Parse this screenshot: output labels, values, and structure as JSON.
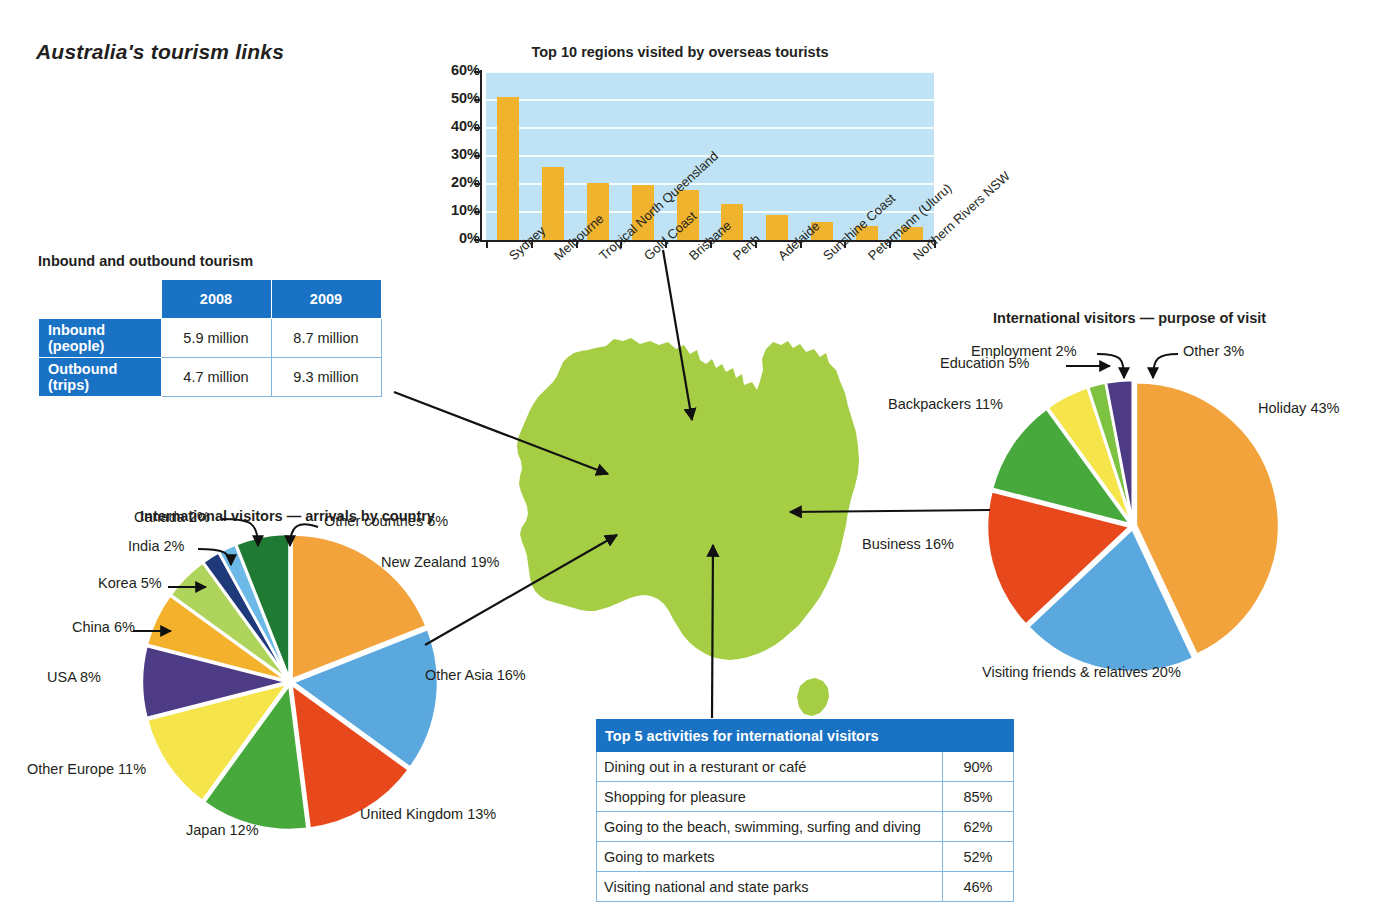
{
  "title": "Australia's tourism links",
  "bar_section": {
    "title": "Top 10 regions visited by overseas tourists"
  },
  "inbound_table": {
    "title": "Inbound and outbound tourism",
    "corner": "",
    "columns": [
      "2008",
      "2009"
    ],
    "rows": [
      {
        "label": "Inbound (people)",
        "v2008": "5.9 million",
        "v2009": "8.7 million"
      },
      {
        "label": "Outbound (trips)",
        "v2008": "4.7 million",
        "v2009": "9.3 million"
      }
    ]
  },
  "activities_table": {
    "title": "Top 5 activities for international visitors",
    "rows": [
      {
        "activity": "Dining out in a resturant or café",
        "pct": "90%"
      },
      {
        "activity": "Shopping for pleasure",
        "pct": "85%"
      },
      {
        "activity": "Going to the beach, swimming, surfing and diving",
        "pct": "62%"
      },
      {
        "activity": "Going to markets",
        "pct": "52%"
      },
      {
        "activity": "Visiting national and state parks",
        "pct": "46%"
      }
    ]
  },
  "arrivals_pie": {
    "title": "International visitors — arrivals by country",
    "labels": {
      "new_zealand": "New Zealand 19%",
      "other_asia": "Other Asia 16%",
      "united_kingdom": "United Kingdom 13%",
      "japan": "Japan 12%",
      "other_europe": "Other Europe 11%",
      "usa": "USA 8%",
      "china": "China 6%",
      "korea": "Korea 5%",
      "india": "India 2%",
      "canada": "Canada 2%",
      "other_countries": "Other countries 6%"
    }
  },
  "purpose_pie": {
    "title": "International visitors — purpose of visit",
    "labels": {
      "holiday": "Holiday 43%",
      "vfr": "Visiting friends & relatives 20%",
      "business": "Business 16%",
      "backpackers": "Backpackers 11%",
      "education": "Education 5%",
      "employment": "Employment 2%",
      "other": "Other 3%"
    }
  },
  "colors": {
    "blue_header": "#1a72c4",
    "plot_blue": "#bfe3f5",
    "bar_gold": "#f0b32d",
    "map_green": "#a5ce44",
    "orange": "#f2a33c",
    "sky": "#5ba8de",
    "red": "#e8491c",
    "green": "#47a83c",
    "yellow": "#f6e44b",
    "purple": "#4d3b86",
    "amber": "#f4b12c",
    "lightgreen": "#aed45c",
    "navy": "#1f3a7a",
    "lightblue": "#6cb9e8",
    "darkgreen": "#1f7a33"
  },
  "chart_data": [
    {
      "type": "bar",
      "title": "Top 10 regions visited by overseas tourists",
      "xlabel": "",
      "ylabel": "",
      "ylim": [
        0,
        60
      ],
      "ytick_labels": [
        "0%",
        "10%",
        "20%",
        "30%",
        "40%",
        "50%",
        "60%"
      ],
      "grid": true,
      "categories": [
        "Sydney",
        "Melbourne",
        "Tropical North Queensland",
        "Gold Coast",
        "Brisbane",
        "Perth",
        "Adelaide",
        "Sunshine Coast",
        "Petermann (Uluru)",
        "Northern Rivers NSW"
      ],
      "values": [
        51,
        26,
        20.5,
        19.5,
        18,
        13,
        9,
        6.5,
        5,
        4.5
      ]
    },
    {
      "type": "pie",
      "title": "International visitors — arrivals by country",
      "legend": "labelled-slices",
      "categories": [
        "New Zealand",
        "Other Asia",
        "United Kingdom",
        "Japan",
        "Other Europe",
        "USA",
        "China",
        "Korea",
        "India",
        "Canada",
        "Other countries"
      ],
      "values": [
        19,
        16,
        13,
        12,
        11,
        8,
        6,
        5,
        2,
        2,
        6
      ],
      "colors": [
        "#f2a33c",
        "#5ba8de",
        "#e8491c",
        "#47a83c",
        "#f6e44b",
        "#4d3b86",
        "#f4b12c",
        "#aed45c",
        "#1f3a7a",
        "#6cb9e8",
        "#1f7a33"
      ]
    },
    {
      "type": "pie",
      "title": "International visitors — purpose of visit",
      "legend": "labelled-slices",
      "categories": [
        "Holiday",
        "Visiting friends & relatives",
        "Business",
        "Backpackers",
        "Education",
        "Employment",
        "Other"
      ],
      "values": [
        43,
        20,
        16,
        11,
        5,
        2,
        3
      ],
      "colors": [
        "#f2a33c",
        "#5ba8de",
        "#e8491c",
        "#47a83c",
        "#f6e44b",
        "#7ec242",
        "#4d3b86"
      ]
    },
    {
      "type": "table",
      "title": "Inbound and outbound tourism",
      "columns": [
        "",
        "2008",
        "2009"
      ],
      "rows": [
        [
          "Inbound (people)",
          "5.9 million",
          "8.7 million"
        ],
        [
          "Outbound (trips)",
          "4.7 million",
          "9.3 million"
        ]
      ]
    },
    {
      "type": "table",
      "title": "Top 5 activities for international visitors",
      "columns": [
        "Activity",
        "%"
      ],
      "rows": [
        [
          "Dining out in a resturant or café",
          "90%"
        ],
        [
          "Shopping for pleasure",
          "85%"
        ],
        [
          "Going to the beach, swimming, surfing and diving",
          "62%"
        ],
        [
          "Going to markets",
          "52%"
        ],
        [
          "Visiting national and state parks",
          "46%"
        ]
      ]
    }
  ]
}
